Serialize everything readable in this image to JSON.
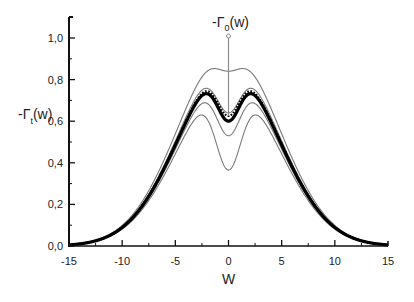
{
  "chart_data": {
    "type": "line",
    "title": "",
    "xlabel": "W",
    "ylabel": "-Γt(w)",
    "ylabel_main": "-Γ",
    "ylabel_sub": "t",
    "ylabel_tail": "(w)",
    "annotation": {
      "text_main": "-Γ",
      "text_sub": "0",
      "text_tail": "(w)",
      "points_to_x": 0,
      "points_to_y": 0.625,
      "arrow_top_y": 1.0
    },
    "xlim": [
      -15,
      15
    ],
    "ylim": [
      0.0,
      1.1
    ],
    "x_ticks": [
      -15,
      -10,
      -5,
      0,
      5,
      10,
      15
    ],
    "x_tick_labels": [
      "-15",
      "-10",
      "-5",
      "0",
      "5",
      "10",
      "15"
    ],
    "x_minor_ticks": [
      -12.5,
      -7.5,
      -2.5,
      2.5,
      7.5,
      12.5
    ],
    "y_ticks": [
      0.0,
      0.2,
      0.4,
      0.6,
      0.8,
      1.0
    ],
    "y_tick_labels": [
      "0,0",
      "0,2",
      "0,4",
      "0,6",
      "0,8",
      "1,0"
    ],
    "y_minor_ticks": [
      0.1,
      0.3,
      0.5,
      0.7,
      0.9
    ],
    "grid": false,
    "legend": null,
    "envelope_sigma": 4.7,
    "series": [
      {
        "name": "curve-1",
        "style": "thin",
        "amplitude": 0.95,
        "dip_depth": 0.11,
        "dip_width": 1.2,
        "peak_value": 0.92,
        "center_value": 0.84
      },
      {
        "name": "curve-2",
        "style": "thin",
        "amplitude": 0.89,
        "dip_depth": 0.25,
        "dip_width": 1.15,
        "peak_value": 0.83,
        "center_value": 0.64
      },
      {
        "name": "curve-dotted",
        "style": "dotted",
        "amplitude": 0.865,
        "dip_depth": 0.24,
        "dip_width": 1.1,
        "peak_value": 0.81,
        "center_value": 0.625
      },
      {
        "name": "curve-thick",
        "style": "thick",
        "amplitude": 0.855,
        "dip_depth": 0.255,
        "dip_width": 1.1,
        "peak_value": 0.8,
        "center_value": 0.6
      },
      {
        "name": "curve-4",
        "style": "thin",
        "amplitude": 0.82,
        "dip_depth": 0.29,
        "dip_width": 1.15,
        "peak_value": 0.77,
        "center_value": 0.53
      },
      {
        "name": "curve-5",
        "style": "thin",
        "amplitude": 0.78,
        "dip_depth": 0.415,
        "dip_width": 1.2,
        "peak_value": 0.73,
        "center_value": 0.365
      }
    ],
    "sample_points": {
      "x": [
        -15,
        -12.5,
        -10,
        -7.5,
        -5,
        -2.5,
        -2,
        -1,
        0,
        1,
        2,
        2.5,
        5,
        7.5,
        10,
        12.5,
        15
      ],
      "curve-thick_y": [
        0.005,
        0.03,
        0.09,
        0.24,
        0.48,
        0.77,
        0.8,
        0.71,
        0.6,
        0.71,
        0.8,
        0.77,
        0.48,
        0.24,
        0.09,
        0.03,
        0.005
      ]
    }
  }
}
